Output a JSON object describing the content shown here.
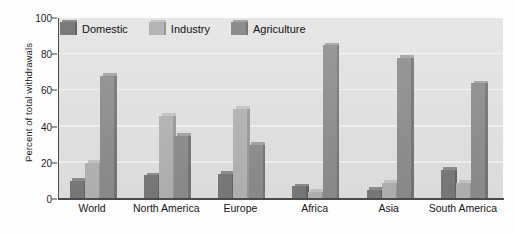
{
  "chart_data": {
    "type": "bar",
    "title": "",
    "subtitle": "",
    "xlabel": "",
    "ylabel": "Percent of total withdrawals",
    "categories": [
      "World",
      "North America",
      "Europe",
      "Africa",
      "Asia",
      "South America"
    ],
    "series": [
      {
        "name": "Domestic",
        "color": "#7a7a7a",
        "values": [
          10,
          13,
          14,
          7,
          5,
          16
        ]
      },
      {
        "name": "Industry",
        "color": "#b4b4b4",
        "values": [
          20,
          46,
          50,
          4,
          9,
          9
        ]
      },
      {
        "name": "Agriculture",
        "color": "#8d8d8d",
        "values": [
          68,
          35,
          30,
          85,
          78,
          64
        ]
      }
    ],
    "ylim": [
      0,
      100
    ],
    "yticks": [
      0,
      20,
      40,
      60,
      80,
      100
    ],
    "ytick_labels": [
      "0",
      "20",
      "40",
      "60",
      "80",
      "100"
    ],
    "grid": true,
    "grid_axis": "y",
    "grid_color": "#f4f4f4",
    "legend_position": "top-left-inside",
    "plot_background": "#e3e3e3",
    "axis_color": "#4a4a4a",
    "bar_style": "3d-shaded"
  }
}
